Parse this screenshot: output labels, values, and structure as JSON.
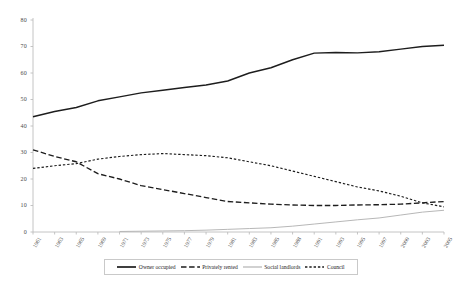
{
  "chart_data": {
    "type": "line",
    "title": "",
    "xlabel": "",
    "ylabel": "",
    "ylim": [
      0,
      80
    ],
    "ytick_step": 10,
    "yticks": [
      0,
      10,
      20,
      30,
      40,
      50,
      60,
      70,
      80
    ],
    "grid": false,
    "legend_position": "bottom",
    "categories": [
      "1961",
      "1963",
      "1965",
      "1969",
      "1971",
      "1973",
      "1975",
      "1977",
      "1979",
      "1981",
      "1983",
      "1985",
      "1988",
      "1991",
      "1993",
      "1995",
      "1997",
      "2000",
      "2003",
      "2005"
    ],
    "series": [
      {
        "name": "Owner occupied",
        "style": "solid-thick",
        "color": "#1d1d1d",
        "values": [
          43.5,
          45.5,
          47.0,
          49.5,
          51.0,
          52.5,
          53.5,
          54.5,
          55.5,
          57.0,
          60.0,
          62.0,
          65.0,
          67.5,
          67.7,
          67.6,
          68.0,
          69.0,
          70.0,
          70.5
        ]
      },
      {
        "name": "Privately rented",
        "style": "dash-long",
        "color": "#1d1d1d",
        "values": [
          31.0,
          28.5,
          26.5,
          22.0,
          20.0,
          17.5,
          16.0,
          14.5,
          13.0,
          11.5,
          11.0,
          10.5,
          10.2,
          10.0,
          10.0,
          10.2,
          10.3,
          10.5,
          11.0,
          11.5
        ]
      },
      {
        "name": "Social landlords",
        "style": "solid-thin-grey",
        "color": "#b3b3b3",
        "values": [
          null,
          null,
          null,
          null,
          0.2,
          0.3,
          0.4,
          0.5,
          0.7,
          1.0,
          1.3,
          1.6,
          2.2,
          3.0,
          3.8,
          4.6,
          5.3,
          6.4,
          7.5,
          8.2
        ]
      },
      {
        "name": "Council",
        "style": "dash-short",
        "color": "#1d1d1d",
        "values": [
          24.0,
          25.0,
          25.8,
          27.5,
          28.5,
          29.2,
          29.6,
          29.2,
          28.8,
          28.0,
          26.5,
          25.0,
          23.0,
          21.0,
          19.0,
          17.0,
          15.5,
          13.5,
          11.0,
          9.5
        ]
      }
    ]
  },
  "legend": {
    "items": [
      {
        "label": "Owner occupied",
        "style": "solid-thick"
      },
      {
        "label": "Privately rented",
        "style": "dash-long"
      },
      {
        "label": "Social landlords",
        "style": "solid-thin-grey"
      },
      {
        "label": "Council",
        "style": "dash-short"
      }
    ]
  }
}
